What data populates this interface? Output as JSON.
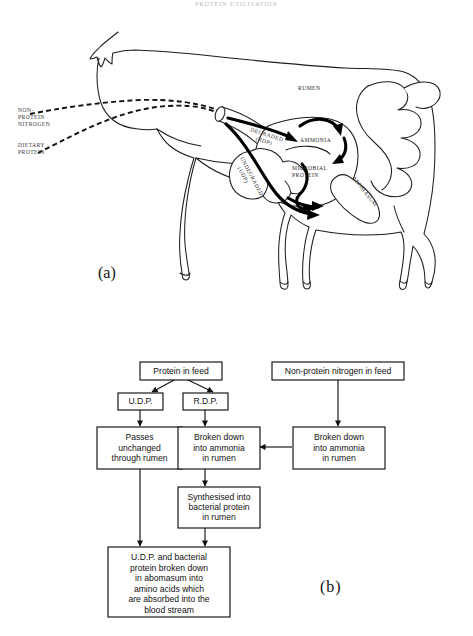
{
  "page": {
    "running_head": "PROTEIN UTILISATION"
  },
  "figure_a": {
    "letter": "(a)",
    "caption_labels": {
      "non_protein_nitrogen": "NON-\nPROTEIN\nNITROGEN",
      "non_protein_nitrogen_l1": "NON-",
      "non_protein_nitrogen_l2": "PROTEIN",
      "non_protein_nitrogen_l3": "NITROGEN",
      "dietary_protein_l1": "DIETARY",
      "dietary_protein_l2": "PROTEIN",
      "rumen": "RUMEN",
      "ammonia": "AMMONIA",
      "microbial_protein_l1": "MICROBIAL",
      "microbial_protein_l2": "PROTEIN",
      "degraded_l1": "DEGRADED",
      "degraded_l2": "(RDP)",
      "undegraded_l1": "UNDEGRADED",
      "undegraded_l2": "(UDP)",
      "abomasum": "ABOMASUM"
    }
  },
  "figure_b": {
    "letter": "(b)",
    "boxes": [
      {
        "id": "protein-in-feed",
        "lines": [
          "Protein in feed"
        ]
      },
      {
        "id": "non-protein-nitrogen",
        "lines": [
          "Non-protein nitrogen in feed"
        ]
      },
      {
        "id": "udp",
        "lines": [
          "U.D.P."
        ]
      },
      {
        "id": "rdp",
        "lines": [
          "R.D.P."
        ]
      },
      {
        "id": "passes-unchanged",
        "lines": [
          "Passes",
          "unchanged",
          "through rumen"
        ]
      },
      {
        "id": "broken-down-rdp",
        "lines": [
          "Broken down",
          "into ammonia",
          "in rumen"
        ]
      },
      {
        "id": "broken-down-npn",
        "lines": [
          "Broken down",
          "into ammonia",
          "in rumen"
        ]
      },
      {
        "id": "synthesised",
        "lines": [
          "Synthesised into",
          "bacterial protein",
          "in rumen"
        ]
      },
      {
        "id": "absorbed",
        "lines": [
          "U.D.P. and bacterial",
          "protein broken down",
          "in abomasum into",
          "amino acids which",
          "are absorbed into the",
          "blood stream"
        ]
      }
    ]
  },
  "colors": {
    "ink": "#111111",
    "paper": "#ffffff",
    "muted_label": "#3a3a3a",
    "running_head": "#b9b9c2"
  }
}
